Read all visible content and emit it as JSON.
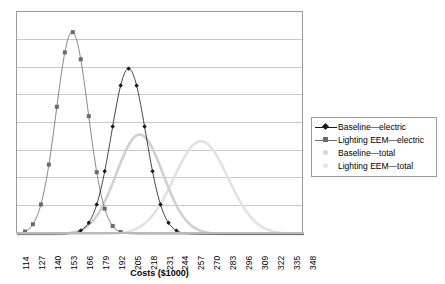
{
  "chart_data": {
    "type": "line",
    "title": "",
    "subtitle": "",
    "xlabel": "Costs ($1000)",
    "ylabel": "",
    "grid": true,
    "legend_position": "right",
    "xlim": [
      114,
      348
    ],
    "ylim": [
      0,
      1
    ],
    "xtick_labels": [
      "114",
      "127",
      "140",
      "153",
      "166",
      "179",
      "192",
      "205",
      "218",
      "231",
      "244",
      "257",
      "270",
      "283",
      "296",
      "309",
      "322",
      "335",
      "348"
    ],
    "xtick_values": [
      114,
      127,
      140,
      153,
      166,
      179,
      192,
      205,
      218,
      231,
      244,
      257,
      270,
      283,
      296,
      309,
      322,
      335,
      348
    ],
    "ytick_labels": [],
    "gridline_count": 7,
    "x": [
      114,
      120,
      127,
      133,
      140,
      146,
      153,
      159,
      166,
      172,
      179,
      185,
      192,
      198,
      205,
      211,
      218,
      224,
      231,
      237,
      244,
      250,
      257,
      263,
      270,
      276,
      283,
      289,
      296,
      302,
      309,
      315,
      322,
      328,
      335,
      341,
      348
    ],
    "series": [
      {
        "name": "Baseline—electric",
        "color": "#1a1a1a",
        "marker": "diamond",
        "mean": 205,
        "sigma": 14,
        "peak_height": 0.745,
        "values": [
          0.0,
          0.0,
          0.0,
          0.001,
          0.002,
          0.007,
          0.02,
          0.047,
          0.1,
          0.185,
          0.305,
          0.449,
          0.595,
          0.703,
          0.745,
          0.705,
          0.598,
          0.452,
          0.307,
          0.187,
          0.101,
          0.048,
          0.021,
          0.007,
          0.002,
          0.001,
          0.0,
          0.0,
          0.0,
          0.0,
          0.0,
          0.0,
          0.0,
          0.0,
          0.0,
          0.0,
          0.0
        ]
      },
      {
        "name": "Lighting EEM—electric",
        "color": "#6b6b6b",
        "marker": "square",
        "mean": 159,
        "sigma": 13,
        "peak_height": 0.91,
        "values": [
          0.012,
          0.042,
          0.118,
          0.263,
          0.477,
          0.71,
          0.88,
          0.91,
          0.808,
          0.6,
          0.38,
          0.206,
          0.097,
          0.039,
          0.014,
          0.004,
          0.001,
          0.0,
          0.0,
          0.0,
          0.0,
          0.0,
          0.0,
          0.0,
          0.0,
          0.0,
          0.0,
          0.0,
          0.0,
          0.0,
          0.0,
          0.0,
          0.0,
          0.0,
          0.0,
          0.0,
          0.0
        ]
      },
      {
        "name": "Baseline—total",
        "color": "#d0d0d0",
        "marker": "dot",
        "mean": 214,
        "sigma": 19,
        "peak_height": 0.448,
        "values": [
          0.0,
          0.0,
          0.0,
          0.0,
          0.0,
          0.001,
          0.003,
          0.008,
          0.021,
          0.049,
          0.099,
          0.175,
          0.272,
          0.365,
          0.43,
          0.448,
          0.418,
          0.345,
          0.256,
          0.17,
          0.1,
          0.053,
          0.025,
          0.01,
          0.004,
          0.001,
          0.0,
          0.0,
          0.0,
          0.0,
          0.0,
          0.0,
          0.0,
          0.0,
          0.0,
          0.0,
          0.0
        ]
      },
      {
        "name": "Lighting EEM—total",
        "color": "#e2e2e2",
        "marker": "dot",
        "mean": 264,
        "sigma": 22,
        "peak_height": 0.418,
        "values": [
          0.0,
          0.0,
          0.0,
          0.0,
          0.0,
          0.0,
          0.0,
          0.0,
          0.0,
          0.001,
          0.002,
          0.006,
          0.015,
          0.034,
          0.068,
          0.123,
          0.198,
          0.285,
          0.364,
          0.41,
          0.418,
          0.387,
          0.322,
          0.245,
          0.168,
          0.105,
          0.059,
          0.03,
          0.014,
          0.006,
          0.002,
          0.001,
          0.0,
          0.0,
          0.0,
          0.0,
          0.0
        ]
      }
    ]
  },
  "legend": {
    "items": [
      {
        "label": "Baseline—electric",
        "color": "#1a1a1a",
        "marker": "diamond"
      },
      {
        "label": "Lighting EEM—electric",
        "color": "#6b6b6b",
        "marker": "square"
      },
      {
        "label": "Baseline—total",
        "color": "#d6d6d6",
        "marker": "dot"
      },
      {
        "label": "Lighting EEM—total",
        "color": "#e6e6e6",
        "marker": "dot"
      }
    ]
  },
  "axis": {
    "x_title": "Costs ($1000)"
  }
}
